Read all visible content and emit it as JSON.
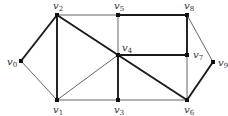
{
  "diagram": {
    "type": "graph",
    "vertices": [
      {
        "id": "v0",
        "name": "v",
        "sub": "0",
        "x": 21,
        "y": 61,
        "lx": 7,
        "ly": 65
      },
      {
        "id": "v1",
        "name": "v",
        "sub": "1",
        "x": 57,
        "y": 100,
        "lx": 53,
        "ly": 113
      },
      {
        "id": "v2",
        "name": "v",
        "sub": "2",
        "x": 57,
        "y": 15,
        "lx": 53,
        "ly": 9
      },
      {
        "id": "v3",
        "name": "v",
        "sub": "3",
        "x": 118,
        "y": 100,
        "lx": 114,
        "ly": 113
      },
      {
        "id": "v4",
        "name": "v",
        "sub": "4",
        "x": 118,
        "y": 55,
        "lx": 122,
        "ly": 51
      },
      {
        "id": "v5",
        "name": "v",
        "sub": "5",
        "x": 118,
        "y": 15,
        "lx": 114,
        "ly": 9
      },
      {
        "id": "v6",
        "name": "v",
        "sub": "6",
        "x": 187,
        "y": 100,
        "lx": 184,
        "ly": 113
      },
      {
        "id": "v7",
        "name": "v",
        "sub": "7",
        "x": 187,
        "y": 55,
        "lx": 193,
        "ly": 58
      },
      {
        "id": "v8",
        "name": "v",
        "sub": "8",
        "x": 187,
        "y": 15,
        "lx": 184,
        "ly": 9
      },
      {
        "id": "v9",
        "name": "v",
        "sub": "9",
        "x": 213,
        "y": 62,
        "lx": 218,
        "ly": 66
      }
    ],
    "edges": [
      {
        "from": "v0",
        "to": "v2",
        "weight": "thick"
      },
      {
        "from": "v0",
        "to": "v1",
        "weight": "thin"
      },
      {
        "from": "v2",
        "to": "v1",
        "weight": "thick"
      },
      {
        "from": "v2",
        "to": "v5",
        "weight": "thin"
      },
      {
        "from": "v2",
        "to": "v4",
        "weight": "thick"
      },
      {
        "from": "v4",
        "to": "v6",
        "weight": "thick"
      },
      {
        "from": "v1",
        "to": "v4",
        "weight": "thin"
      },
      {
        "from": "v1",
        "to": "v3",
        "weight": "thin"
      },
      {
        "from": "v5",
        "to": "v4",
        "weight": "thin"
      },
      {
        "from": "v4",
        "to": "v3",
        "weight": "thick"
      },
      {
        "from": "v5",
        "to": "v8",
        "weight": "thick"
      },
      {
        "from": "v4",
        "to": "v7",
        "weight": "thick"
      },
      {
        "from": "v8",
        "to": "v7",
        "weight": "thick"
      },
      {
        "from": "v7",
        "to": "v6",
        "weight": "thin"
      },
      {
        "from": "v3",
        "to": "v6",
        "weight": "thin"
      },
      {
        "from": "v8",
        "to": "v9",
        "weight": "thin"
      },
      {
        "from": "v9",
        "to": "v6",
        "weight": "thick"
      }
    ]
  }
}
